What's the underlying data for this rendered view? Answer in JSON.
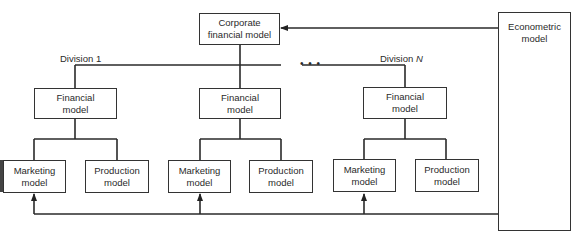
{
  "diagram": {
    "corporate": {
      "line1": "Corporate",
      "line2": "financial model"
    },
    "econometric": {
      "line1": "Econometric",
      "line2": "model"
    },
    "division_labels": {
      "first": "Division 1",
      "last_prefix": "Division ",
      "last_var": "N"
    },
    "ellipsis": "• • •",
    "divisions": [
      {
        "financial": {
          "line1": "Financial",
          "line2": "model"
        },
        "marketing": {
          "line1": "Marketing",
          "line2": "model"
        },
        "production": {
          "line1": "Production",
          "line2": "model"
        }
      },
      {
        "financial": {
          "line1": "Financial",
          "line2": "model"
        },
        "marketing": {
          "line1": "Marketing",
          "line2": "model"
        },
        "production": {
          "line1": "Production",
          "line2": "model"
        }
      },
      {
        "financial": {
          "line1": "Financial",
          "line2": "model"
        },
        "marketing": {
          "line1": "Marketing",
          "line2": "model"
        },
        "production": {
          "line1": "Production",
          "line2": "model"
        }
      }
    ]
  }
}
